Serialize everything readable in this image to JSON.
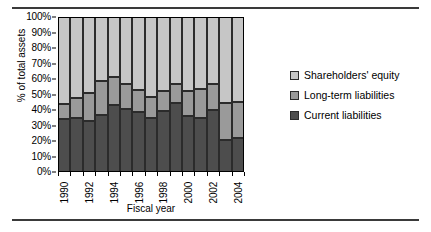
{
  "chart_data": {
    "type": "bar",
    "subtype": "stacked-bar-100-percent",
    "title": "",
    "xlabel": "Fiscal year",
    "ylabel": "% of total assets",
    "ylim": [
      0,
      100
    ],
    "ytick_labels": [
      "100%",
      "90%",
      "80%",
      "70%",
      "60%",
      "50%",
      "40%",
      "30%",
      "20%",
      "10%",
      "0%"
    ],
    "ytick_values": [
      100,
      90,
      80,
      70,
      60,
      50,
      40,
      30,
      20,
      10,
      0
    ],
    "grid": false,
    "legend_position": "right",
    "categories": [
      1990,
      1991,
      1992,
      1993,
      1994,
      1995,
      1996,
      1997,
      1998,
      1999,
      2000,
      2001,
      2002,
      2003,
      2004
    ],
    "xtick_labels": [
      "1990",
      "",
      "1992",
      "",
      "1994",
      "",
      "1996",
      "",
      "1998",
      "",
      "2000",
      "",
      "2002",
      "",
      "2004"
    ],
    "series": [
      {
        "name": "Current liabilities",
        "color": "#4d4d4d",
        "values": [
          34,
          35,
          33,
          37,
          43.5,
          40.5,
          38.5,
          35,
          39.5,
          44.5,
          36,
          35,
          40,
          20.5,
          22
        ]
      },
      {
        "name": "Long-term liabilities",
        "color": "#9a9a9a",
        "values": [
          10,
          13,
          18,
          21.5,
          17.5,
          16.5,
          14.5,
          13.5,
          12.5,
          12.5,
          16.5,
          18.5,
          17,
          24,
          23
        ]
      },
      {
        "name": "Shareholders' equity",
        "color": "#c6c6c6",
        "values": [
          56,
          52,
          49,
          41.5,
          39,
          43,
          47,
          51.5,
          48,
          43,
          47.5,
          46.5,
          43,
          55.5,
          55
        ]
      }
    ],
    "cumulative_tops": {
      "current": [
        34,
        35,
        33,
        37,
        43.5,
        40.5,
        38.5,
        35,
        39.5,
        44.5,
        36,
        35,
        40,
        20.5,
        22
      ],
      "current_plus_longterm": [
        44,
        48,
        51,
        58.5,
        61,
        57,
        53,
        48.5,
        52,
        57,
        52.5,
        53.5,
        57,
        44.5,
        45
      ]
    }
  },
  "legend": {
    "items": [
      {
        "label": "Shareholders' equity",
        "key": "equity"
      },
      {
        "label": "Long-term liabilities",
        "key": "longterm"
      },
      {
        "label": "Current liabilities",
        "key": "current"
      }
    ]
  },
  "colors": {
    "equity": "#c6c6c6",
    "longterm": "#9a9a9a",
    "current": "#4d4d4d",
    "outline": "#2b2b2b",
    "rule": "#3a3a3a"
  }
}
